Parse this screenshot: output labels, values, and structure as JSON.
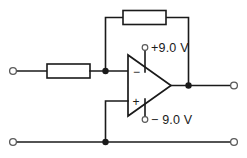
{
  "diagram": {
    "background_color": "#ffffff",
    "line_color": "#1a1a1a",
    "terminal_stroke_color": "#5a5a5a"
  },
  "labels": {
    "positive_supply": "+9.0 V",
    "negative_supply": "− 9.0 V",
    "inverting_pin": "−",
    "noninverting_pin": "+"
  },
  "components": {
    "input_resistor": {
      "name": "input-resistor",
      "label": ""
    },
    "feedback_resistor": {
      "name": "feedback-resistor",
      "label": ""
    },
    "opamp": {
      "name": "operational-amplifier",
      "label": ""
    }
  },
  "terminals": {
    "input_top_left": "input-terminal",
    "input_bottom_left": "ground-terminal-left",
    "output_top_right": "output-terminal",
    "output_bottom_right": "ground-terminal-right",
    "v_positive": "positive-supply-terminal",
    "v_negative": "negative-supply-terminal"
  },
  "nodes": {
    "summing_junction": "summing-junction-node",
    "output_junction": "output-junction-node",
    "ground_junction": "ground-junction-node"
  }
}
